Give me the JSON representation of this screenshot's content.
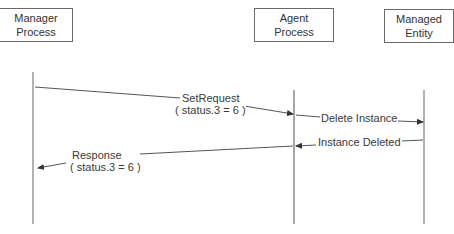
{
  "participants": [
    {
      "id": "manager",
      "line1": "Manager",
      "line2": "Process"
    },
    {
      "id": "agent",
      "line1": "Agent",
      "line2": "Process"
    },
    {
      "id": "managed",
      "line1": "Managed",
      "line2": "Entity"
    }
  ],
  "messages": [
    {
      "from": "manager",
      "to": "agent",
      "line1": "SetRequest",
      "line2": "( status.3 = 6 )"
    },
    {
      "from": "agent",
      "to": "managed",
      "line1": "Delete Instance"
    },
    {
      "from": "managed",
      "to": "agent",
      "line1": "Instance Deleted"
    },
    {
      "from": "agent",
      "to": "manager",
      "line1": "Response",
      "line2": "( status.3 = 6 )"
    }
  ],
  "colors": {
    "line": "#555555",
    "box_border": "#6a6a6a",
    "text": "#333333"
  }
}
